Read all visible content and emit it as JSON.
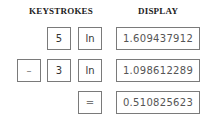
{
  "headers": {
    "keystrokes": "KEYSTROKES",
    "display": "DISPLAY"
  },
  "rows": [
    {
      "keys": [
        "5",
        "ln"
      ],
      "display": "1.609437912"
    },
    {
      "keys": [
        "–",
        "3",
        "ln"
      ],
      "display": "1.098612289"
    },
    {
      "keys": [
        "="
      ],
      "display": "0.510825623"
    }
  ]
}
